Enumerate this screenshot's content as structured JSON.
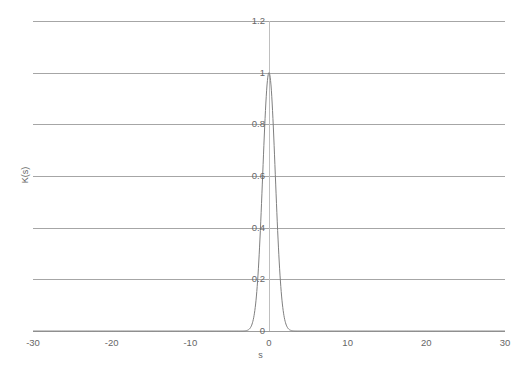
{
  "chart_data": {
    "type": "line",
    "title": "",
    "xlabel": "s",
    "ylabel": "K(s)",
    "xlim": [
      -30,
      30
    ],
    "ylim": [
      0,
      1.2
    ],
    "grid": true,
    "legend": "none",
    "x_ticks": [
      "-30",
      "-20",
      "-10",
      "0",
      "10",
      "20",
      "30"
    ],
    "x_tick_values": [
      -30,
      -20,
      -10,
      0,
      10,
      20,
      30
    ],
    "y_ticks": [
      "0",
      "0.2",
      "0.4",
      "0.6",
      "0.8",
      "1",
      "1.2"
    ],
    "y_tick_values": [
      0,
      0.2,
      0.4,
      0.6,
      0.8,
      1,
      1.2
    ],
    "series": [
      {
        "name": "K(s)",
        "color": "#7f7f7f",
        "description": "Gaussian kernel centered at s = 0, peak value 1.0, standard deviation approximately 0.8",
        "x": [
          -30,
          -28,
          -26,
          -24,
          -22,
          -20,
          -18,
          -16,
          -14,
          -12,
          -10,
          -8,
          -6,
          -5,
          -4,
          -3.5,
          -3,
          -2.75,
          -2.5,
          -2.25,
          -2,
          -1.75,
          -1.5,
          -1.25,
          -1,
          -0.75,
          -0.5,
          -0.25,
          0,
          0.25,
          0.5,
          0.75,
          1,
          1.25,
          1.5,
          1.75,
          2,
          2.25,
          2.5,
          2.75,
          3,
          3.5,
          4,
          5,
          6,
          8,
          10,
          12,
          14,
          16,
          18,
          20,
          22,
          24,
          26,
          28,
          30
        ],
        "y": [
          0,
          0,
          0,
          0,
          0,
          0,
          0,
          0,
          0,
          0,
          0,
          0,
          0.0,
          0.0001,
          0.0012,
          0.0047,
          0.0156,
          0.0265,
          0.043,
          0.0672,
          0.1015,
          0.148,
          0.2084,
          0.2831,
          0.3711,
          0.4696,
          0.5738,
          0.6777,
          0.7742,
          0.6777,
          0.5738,
          0.4696,
          0.3711,
          0.2831,
          0.2084,
          0.148,
          0.1015,
          0.0672,
          0.043,
          0.0265,
          0.0156,
          0.0047,
          0.0012,
          0.0001,
          0.0,
          0,
          0,
          0,
          0,
          0,
          0,
          0,
          0,
          0,
          0,
          0,
          0
        ],
        "peak_x": 0,
        "peak_y": 1.0
      }
    ],
    "axis_line_color": "#a6a6a6",
    "vertical_axis_x_value": 0
  }
}
